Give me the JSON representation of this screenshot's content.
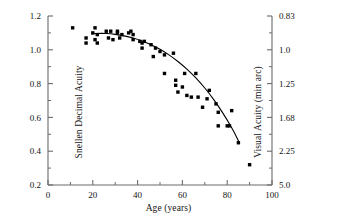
{
  "chart_data": {
    "type": "scatter",
    "title": "",
    "xlabel": "Age (years)",
    "ylabel": "Snellen Decimal Acuity",
    "y2label": "Visual Acuity (min arc)",
    "xlim": [
      0,
      100
    ],
    "ylim": [
      0.2,
      1.2
    ],
    "grid": false,
    "legend": "none",
    "xticks": [
      0,
      20,
      40,
      60,
      80,
      100
    ],
    "xtick_labels": [
      "0",
      "20",
      "40",
      "60",
      "80",
      "100"
    ],
    "xminor_ticks": [
      10,
      30,
      50,
      70,
      90
    ],
    "yticks": [
      0.2,
      0.4,
      0.6,
      0.8,
      1.0,
      1.2
    ],
    "ytick_labels": [
      "0.2",
      "0.4",
      "0.6",
      "0.8",
      "1.0",
      "1.2"
    ],
    "yminor_ticks": [
      0.3,
      0.5,
      0.7,
      0.9,
      1.1
    ],
    "y2ticks": [
      0.2,
      0.4,
      0.6,
      0.8,
      1.0,
      1.2
    ],
    "y2tick_labels": [
      "5.0",
      "2.25",
      "1.68",
      "1.25",
      "1.0",
      "0.83"
    ],
    "marker": "square",
    "marker_color": "#000000",
    "marker_size": 3.4,
    "curve_color": "#000000",
    "axis_color": "#6b6b6b",
    "series": [
      {
        "name": "Snellen decimal acuity vs age",
        "points": [
          [
            11,
            1.13
          ],
          [
            17,
            1.07
          ],
          [
            17,
            1.04
          ],
          [
            20,
            1.1
          ],
          [
            21,
            1.13
          ],
          [
            21,
            1.06
          ],
          [
            22,
            1.09
          ],
          [
            22,
            1.04
          ],
          [
            26,
            1.11
          ],
          [
            27,
            1.07
          ],
          [
            28,
            1.11
          ],
          [
            29,
            1.06
          ],
          [
            31,
            1.1
          ],
          [
            31,
            1.11
          ],
          [
            32,
            1.07
          ],
          [
            33,
            1.09
          ],
          [
            36,
            1.1
          ],
          [
            37,
            1.11
          ],
          [
            38,
            1.09
          ],
          [
            38,
            1.06
          ],
          [
            41,
            1.05
          ],
          [
            42,
            1.04
          ],
          [
            42,
            1.01
          ],
          [
            43,
            1.05
          ],
          [
            46,
            1.03
          ],
          [
            47,
            0.96
          ],
          [
            48,
            1.01
          ],
          [
            50,
            0.99
          ],
          [
            52,
            0.97
          ],
          [
            52,
            0.86
          ],
          [
            56,
            0.98
          ],
          [
            57,
            0.82
          ],
          [
            57,
            0.79
          ],
          [
            58,
            0.75
          ],
          [
            60,
            0.78
          ],
          [
            61,
            0.86
          ],
          [
            62,
            0.73
          ],
          [
            64,
            0.72
          ],
          [
            66,
            0.86
          ],
          [
            67,
            0.72
          ],
          [
            69,
            0.66
          ],
          [
            71,
            0.71
          ],
          [
            72,
            0.76
          ],
          [
            75,
            0.68
          ],
          [
            76,
            0.63
          ],
          [
            76,
            0.55
          ],
          [
            80,
            0.55
          ],
          [
            81,
            0.55
          ],
          [
            82,
            0.64
          ],
          [
            85,
            0.45
          ],
          [
            90,
            0.32
          ]
        ]
      }
    ],
    "fit_curve": {
      "name": "fitted decline curve",
      "points": [
        [
          19.5,
          1.095
        ],
        [
          24,
          1.098
        ],
        [
          28,
          1.095
        ],
        [
          32,
          1.088
        ],
        [
          36,
          1.077
        ],
        [
          40,
          1.062
        ],
        [
          44,
          1.042
        ],
        [
          48,
          1.018
        ],
        [
          52,
          0.988
        ],
        [
          56,
          0.952
        ],
        [
          60,
          0.91
        ],
        [
          64,
          0.862
        ],
        [
          68,
          0.806
        ],
        [
          72,
          0.742
        ],
        [
          76,
          0.668
        ],
        [
          80,
          0.585
        ],
        [
          83,
          0.515
        ],
        [
          85,
          0.462
        ]
      ]
    }
  }
}
